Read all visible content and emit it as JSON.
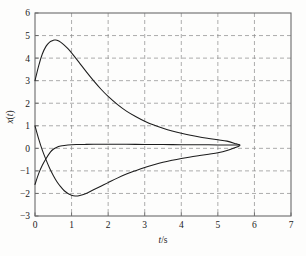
{
  "chart_data": {
    "type": "line",
    "title": "",
    "xlabel": "t/s",
    "ylabel": "x(t)",
    "xlim": [
      0,
      7
    ],
    "ylim": [
      -3,
      6
    ],
    "xticks": [
      0,
      1,
      2,
      3,
      4,
      5,
      6,
      7
    ],
    "xtick_labels": [
      "0",
      "1",
      "2",
      "3",
      "4",
      "5",
      "6",
      "7"
    ],
    "yticks": [
      -3,
      -2,
      -1,
      0,
      1,
      2,
      3,
      4,
      5,
      6
    ],
    "ytick_labels": [
      "-3",
      "-2",
      "-1",
      "0",
      "1",
      "2",
      "3",
      "4",
      "5",
      "6"
    ],
    "grid": true,
    "grid_style": "dashed",
    "legend": null,
    "line_color": "#1c1c1c",
    "grid_color": "#8a8a8a",
    "frame_color": "#6b6b6b",
    "background": "#fdfdfc",
    "x_end": 5.6,
    "series": [
      {
        "name": "curve-upper",
        "x": [
          0,
          0.1,
          0.2,
          0.3,
          0.4,
          0.5,
          0.55,
          0.6,
          0.7,
          0.8,
          0.9,
          1.0,
          1.2,
          1.4,
          1.6,
          1.8,
          2.0,
          2.25,
          2.5,
          2.75,
          3.0,
          3.25,
          3.5,
          3.75,
          4.0,
          4.25,
          4.5,
          4.75,
          5.0,
          5.25,
          5.5,
          5.6
        ],
        "y": [
          3.0,
          3.66,
          4.18,
          4.52,
          4.71,
          4.79,
          4.8,
          4.79,
          4.71,
          4.58,
          4.42,
          4.23,
          3.82,
          3.4,
          3.0,
          2.63,
          2.3,
          1.95,
          1.65,
          1.41,
          1.2,
          1.03,
          0.89,
          0.77,
          0.67,
          0.58,
          0.5,
          0.44,
          0.38,
          0.32,
          0.2,
          0.15
        ]
      },
      {
        "name": "curve-middle",
        "x": [
          0,
          0.1,
          0.2,
          0.3,
          0.42,
          0.5,
          0.6,
          0.7,
          0.8,
          0.9,
          1.0,
          1.2,
          1.4,
          1.6,
          1.8,
          2.0,
          2.5,
          3.0,
          3.5,
          4.0,
          4.5,
          5.0,
          5.5,
          5.6
        ],
        "y": [
          -1.6,
          -1.12,
          -0.75,
          -0.46,
          -0.17,
          -0.04,
          0.05,
          0.1,
          0.13,
          0.15,
          0.16,
          0.17,
          0.175,
          0.18,
          0.18,
          0.18,
          0.18,
          0.17,
          0.17,
          0.16,
          0.16,
          0.15,
          0.15,
          0.15
        ]
      },
      {
        "name": "curve-lower",
        "x": [
          0,
          0.1,
          0.2,
          0.3,
          0.4,
          0.5,
          0.6,
          0.7,
          0.8,
          0.9,
          1.0,
          1.1,
          1.2,
          1.4,
          1.6,
          1.8,
          2.0,
          2.25,
          2.5,
          2.75,
          3.0,
          3.25,
          3.5,
          3.75,
          4.0,
          4.25,
          4.5,
          4.75,
          5.0,
          5.25,
          5.5,
          5.6
        ],
        "y": [
          1.0,
          0.42,
          -0.08,
          -0.5,
          -0.88,
          -1.2,
          -1.48,
          -1.7,
          -1.88,
          -2.0,
          -2.08,
          -2.11,
          -2.1,
          -2.0,
          -1.84,
          -1.68,
          -1.52,
          -1.32,
          -1.14,
          -0.99,
          -0.85,
          -0.73,
          -0.62,
          -0.53,
          -0.45,
          -0.38,
          -0.32,
          -0.26,
          -0.2,
          -0.1,
          0.05,
          0.12
        ]
      }
    ]
  }
}
